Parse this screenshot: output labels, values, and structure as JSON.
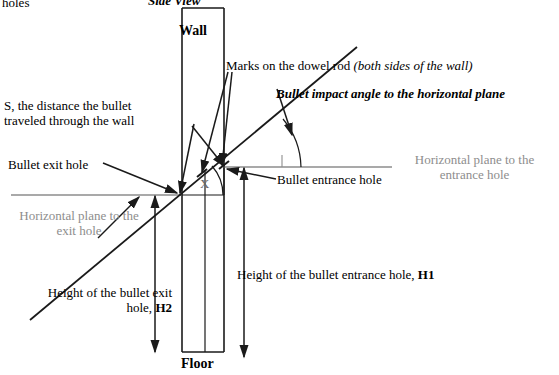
{
  "diagram": {
    "title": "Side View",
    "top_fragment": "holes",
    "wall_label": "Wall",
    "floor_label": "Floor",
    "angle_symbol": "X",
    "labels": {
      "marks_on_dowel_plain": "Marks on the dowel rod ",
      "marks_on_dowel_italic": "(both sides of the wall)",
      "s_distance_line1": "S, the distance the bullet",
      "s_distance_line2": "traveled through the wall",
      "s_distance_bold_prefix": "S",
      "bullet_impact_angle": "Bullet impact angle to the horizontal plane",
      "bullet_exit_hole": "Bullet exit hole",
      "bullet_entrance_hole": "Bullet entrance hole",
      "horizontal_plane_entrance_line1": "Horizontal plane to the",
      "horizontal_plane_entrance_line2": "entrance hole",
      "horizontal_plane_exit_line1": "Horizontal plane to the",
      "horizontal_plane_exit_line2": "exit hole",
      "height_entrance_text": "Height of the bullet entrance hole, ",
      "height_entrance_symbol": "H1",
      "height_exit_line1": "Height of the bullet exit",
      "height_exit_line2_text": "hole, ",
      "height_exit_symbol": "H2"
    },
    "colors": {
      "stroke": "#1a1a1a",
      "gray_line": "#8d8d8d",
      "gray_text": "#8d8d8d",
      "background": "#ffffff"
    },
    "geometry": {
      "wall_left_x": 182,
      "wall_right_x": 224,
      "wall_top_y": 8,
      "wall_bottom_y": 352,
      "exit_hole": [
        179,
        195
      ],
      "entrance_hole": [
        223,
        167
      ],
      "trajectory_start": [
        30,
        320
      ],
      "trajectory_end": [
        357,
        47
      ],
      "h1_arrow_x": 244,
      "h2_arrow_x": 155,
      "floor_y": 352
    }
  }
}
